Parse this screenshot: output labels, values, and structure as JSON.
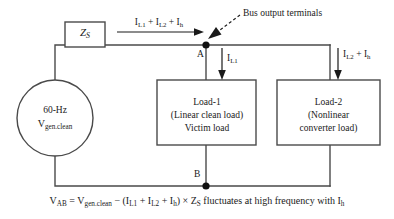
{
  "diagram": {
    "line_color": "#4a4a4a",
    "text_color": "#1a1a1a",
    "source": {
      "frequency_label": "60-Hz",
      "voltage_symbol": "V",
      "voltage_subscript": "gen.clean"
    },
    "impedance": {
      "symbol": "Z",
      "subscript": "S"
    },
    "top_current": {
      "terms": "I",
      "full_label": "I_L1 + I_L2 + I_h",
      "parts": [
        "I",
        "L1",
        " + ",
        "I",
        "L2",
        " + ",
        "I",
        "h"
      ]
    },
    "nodes": {
      "a_label": "A",
      "b_label": "B"
    },
    "callout": {
      "text": "Bus output terminals"
    },
    "branch1_current": {
      "symbol": "I",
      "subscript": "L1"
    },
    "branch2_current": {
      "symbol1": "I",
      "subscript1": "L2",
      "plus": " + ",
      "symbol2": "I",
      "subscript2": "h"
    },
    "load1": {
      "line1": "Load-1",
      "line2": "(Linear clean load)",
      "line3": "Victim load"
    },
    "load2": {
      "line1": "Load-2",
      "line2": "(Nonlinear",
      "line3": "converter load)"
    },
    "equation": {
      "lhs_symbol": "V",
      "lhs_subscript": "AB",
      "equals": " = ",
      "rhs_v_symbol": "V",
      "rhs_v_subscript": "gen.clean",
      "minus": " − ",
      "open_paren": "(",
      "i1": "I",
      "i1_sub": "L1",
      "plus1": " + ",
      "i2": "I",
      "i2_sub": "L2",
      "plus2": " + ",
      "i3": "I",
      "i3_sub": "h",
      "close_paren": ")",
      "times": " × ",
      "z_symbol": "Z",
      "z_subscript": "S",
      "tail": " fluctuates at high frequency with ",
      "tail_i": "I",
      "tail_i_sub": "h",
      "full_text": "V_AB = V_gen.clean − (I_L1 + I_L2 + I_h) × Z_S fluctuates at high frequency with I_h"
    }
  }
}
